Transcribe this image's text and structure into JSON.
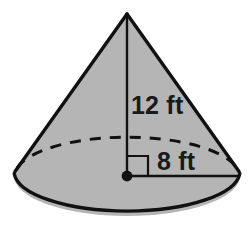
{
  "figure": {
    "name": "cone-with-dimensions",
    "shape": "cone",
    "colors": {
      "fill": "#b5b5b5",
      "stroke": "#111111",
      "background": "#ffffff",
      "text": "#1a1a1a"
    },
    "labels": {
      "height": "12 ft",
      "radius": "8 ft"
    },
    "measurements": [
      {
        "name": "height",
        "value": 12,
        "unit": "ft",
        "label": "12 ft"
      },
      {
        "name": "radius",
        "value": 8,
        "unit": "ft",
        "label": "8 ft"
      }
    ],
    "parts": {
      "apex": "cone-apex",
      "base": "cone-base-ellipse",
      "hidden_base_arc": "cone-base-hidden-arc",
      "height_line": "height-segment",
      "radius_line": "radius-segment",
      "right_angle": "right-angle-marker",
      "center_point": "base-center-point"
    }
  }
}
